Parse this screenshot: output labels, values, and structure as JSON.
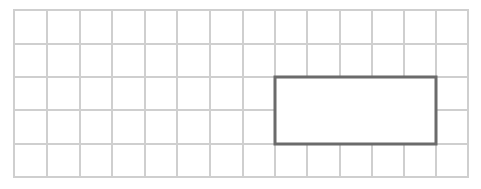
{
  "grid": {
    "columns": 14,
    "rows": 5,
    "x_lines": [
      14,
      47,
      80,
      112,
      145,
      177,
      210,
      243,
      275,
      307,
      340,
      372,
      404,
      436,
      468
    ],
    "y_lines": [
      10,
      44,
      77,
      110,
      144,
      177
    ],
    "line_color": "#cfcfcf",
    "line_width": 2
  },
  "highlight_rectangle": {
    "col_start": 8,
    "col_end": 13,
    "row_start": 2,
    "row_end": 4,
    "width_cells": 5,
    "height_cells": 2,
    "x": 275,
    "y": 77,
    "width": 161,
    "height": 67,
    "stroke_color": "#6b6b6b",
    "stroke_width": 3,
    "fill": "#ffffff"
  }
}
